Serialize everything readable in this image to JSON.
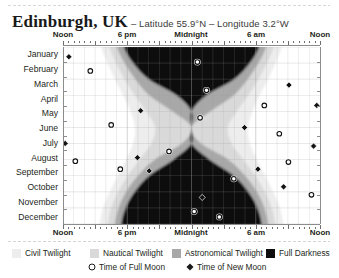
{
  "title": {
    "place": "Edinburgh, UK",
    "coords": "– Latitude 55.9°N – Longitude 3.2°W"
  },
  "axes": {
    "x_label_top_1": "Noon",
    "x_label_top_2": "6 pm",
    "x_label_top_3": "Midnight",
    "x_label_top_4": "6 am",
    "x_label_top_5": "Noon",
    "x_label_bottom_1": "Noon",
    "x_label_bottom_2": "6 pm",
    "x_label_bottom_3": "Midnight",
    "x_label_bottom_4": "6 am",
    "x_label_bottom_5": "Noon",
    "months": [
      "January",
      "February",
      "March",
      "April",
      "May",
      "June",
      "July",
      "August",
      "September",
      "October",
      "November",
      "December"
    ]
  },
  "legend": {
    "civil": "Civil Twilight",
    "nautical": "Nautical Twilight",
    "astronomical": "Astronomical Twilight",
    "darkness": "Full Darkness",
    "full_moon": "Time of Full Moon",
    "new_moon": "Time of New Moon"
  },
  "colors": {
    "daylight": "#ffffff",
    "civil": "#ededed",
    "nautical": "#d9d9d9",
    "astronomical": "#a8a8a8",
    "darkness": "#0d0d0d",
    "grid": "#9a9a9a",
    "axis": "#8c8c8c",
    "text": "#231f20"
  },
  "chart_data": {
    "type": "area",
    "xlabel": "Time of day",
    "ylabel": "Month of year",
    "xlim": [
      0,
      24
    ],
    "ylim": [
      "January",
      "December"
    ],
    "xticks": [
      0,
      6,
      12,
      18,
      24
    ],
    "xticklabels": [
      "Noon",
      "6 pm",
      "Midnight",
      "6 am",
      "Noon"
    ],
    "grid": true,
    "legend_position": "bottom",
    "bands": [
      {
        "name": "Civil Twilight",
        "color": "#ededed"
      },
      {
        "name": "Nautical Twilight",
        "color": "#d9d9d9"
      },
      {
        "name": "Astronomical Twilight",
        "color": "#a8a8a8"
      },
      {
        "name": "Full Darkness",
        "color": "#0d0d0d"
      }
    ],
    "series": [
      {
        "name": "Sunset (civil start)",
        "values": [
          3.6,
          4.15,
          4.85,
          5.62,
          6.3,
          6.72,
          6.55,
          5.9,
          5.12,
          4.38,
          3.75,
          3.45
        ]
      },
      {
        "name": "Sunrise (civil end)",
        "values": [
          20.4,
          19.85,
          19.15,
          18.38,
          17.7,
          17.28,
          17.45,
          18.1,
          18.88,
          19.62,
          20.25,
          20.55
        ]
      },
      {
        "name": "Nautical dusk",
        "values": [
          4.35,
          4.95,
          5.75,
          6.7,
          7.75,
          8.6,
          8.25,
          7.15,
          6.05,
          5.15,
          4.5,
          4.2
        ]
      },
      {
        "name": "Nautical dawn",
        "values": [
          19.65,
          19.05,
          18.25,
          17.3,
          16.25,
          15.4,
          15.75,
          16.85,
          17.95,
          18.85,
          19.5,
          19.8
        ]
      },
      {
        "name": "Astronomical dusk",
        "values": [
          5.05,
          5.75,
          6.75,
          8.05,
          10.2,
          12.0,
          11.1,
          8.55,
          7.0,
          5.9,
          5.2,
          4.85
        ]
      },
      {
        "name": "Astronomical dawn",
        "values": [
          18.95,
          18.25,
          17.25,
          15.95,
          13.8,
          12.0,
          12.9,
          15.45,
          17.0,
          18.1,
          18.8,
          19.15
        ]
      },
      {
        "name": "Full darkness start",
        "values": [
          5.7,
          6.55,
          8.0,
          10.6,
          12.0,
          12.0,
          12.0,
          10.3,
          8.05,
          6.7,
          5.85,
          5.45
        ]
      },
      {
        "name": "Full darkness end",
        "values": [
          18.3,
          17.45,
          16.0,
          13.4,
          12.0,
          12.0,
          12.0,
          13.7,
          15.95,
          17.3,
          18.15,
          18.55
        ]
      }
    ],
    "markers": [
      {
        "type": "new",
        "x": 0.55,
        "y": 0.055
      },
      {
        "type": "full",
        "x": 12.55,
        "y": 0.085
      },
      {
        "type": "full",
        "x": 2.55,
        "y": 0.135
      },
      {
        "type": "full",
        "x": 13.4,
        "y": 0.245
      },
      {
        "type": "new",
        "x": 21.1,
        "y": 0.215
      },
      {
        "type": "new",
        "x": 23.7,
        "y": 0.33
      },
      {
        "type": "new",
        "x": 7.25,
        "y": 0.36
      },
      {
        "type": "full",
        "x": 18.8,
        "y": 0.33
      },
      {
        "type": "full",
        "x": 12.8,
        "y": 0.4
      },
      {
        "type": "full",
        "x": 4.5,
        "y": 0.44
      },
      {
        "type": "new",
        "x": 16.95,
        "y": 0.455
      },
      {
        "type": "full",
        "x": 20.2,
        "y": 0.49
      },
      {
        "type": "new",
        "x": 0.2,
        "y": 0.545
      },
      {
        "type": "new",
        "x": 23.4,
        "y": 0.56
      },
      {
        "type": "full",
        "x": 9.9,
        "y": 0.59
      },
      {
        "type": "new",
        "x": 6.95,
        "y": 0.625
      },
      {
        "type": "full",
        "x": 1.15,
        "y": 0.645
      },
      {
        "type": "full",
        "x": 5.35,
        "y": 0.69
      },
      {
        "type": "new",
        "x": 8.05,
        "y": 0.7
      },
      {
        "type": "new",
        "x": 18.2,
        "y": 0.69
      },
      {
        "type": "full",
        "x": 21.05,
        "y": 0.65
      },
      {
        "type": "full",
        "x": 15.95,
        "y": 0.745
      },
      {
        "type": "new",
        "x": 20.6,
        "y": 0.79
      },
      {
        "type": "full",
        "x": 23.2,
        "y": 0.835
      },
      {
        "type": "new",
        "x": 13.0,
        "y": 0.85
      },
      {
        "type": "full",
        "x": 12.25,
        "y": 0.93
      },
      {
        "type": "full",
        "x": 14.6,
        "y": 0.96
      }
    ]
  }
}
